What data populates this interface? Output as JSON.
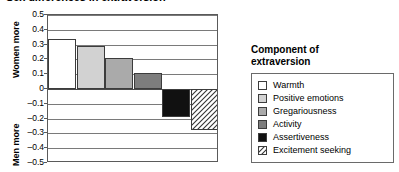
{
  "chart_title": "Sex differences in extraversion",
  "axis_labels": {
    "upper": "Women more",
    "lower": "Men more"
  },
  "legend": {
    "title_line1": "Component of",
    "title_line2": "extraversion"
  },
  "chart_data": {
    "type": "bar",
    "title": "Sex differences in extraversion",
    "xlabel": "",
    "ylabel": "",
    "ylim": [
      -0.5,
      0.5
    ],
    "grid": true,
    "legend_position": "right",
    "ticks": [
      "0.5",
      "0.4",
      "0.3",
      "0.2",
      "0.1",
      "0",
      "–0.1",
      "–0.2",
      "–0.3",
      "–0.4",
      "–0.5"
    ],
    "categories": [
      "Warmth",
      "Positive emotions",
      "Gregariousness",
      "Activity",
      "Assertiveness",
      "Excitement seeking"
    ],
    "values": [
      0.34,
      0.29,
      0.21,
      0.11,
      -0.19,
      -0.28
    ],
    "fills": [
      "#ffffff",
      "#d2d2d2",
      "#aaaaaa",
      "#7d7d7d",
      "#111111",
      "hatch"
    ],
    "series": [
      {
        "name": "Effect size (d)",
        "values": [
          0.34,
          0.29,
          0.21,
          0.11,
          -0.19,
          -0.28
        ]
      }
    ]
  }
}
